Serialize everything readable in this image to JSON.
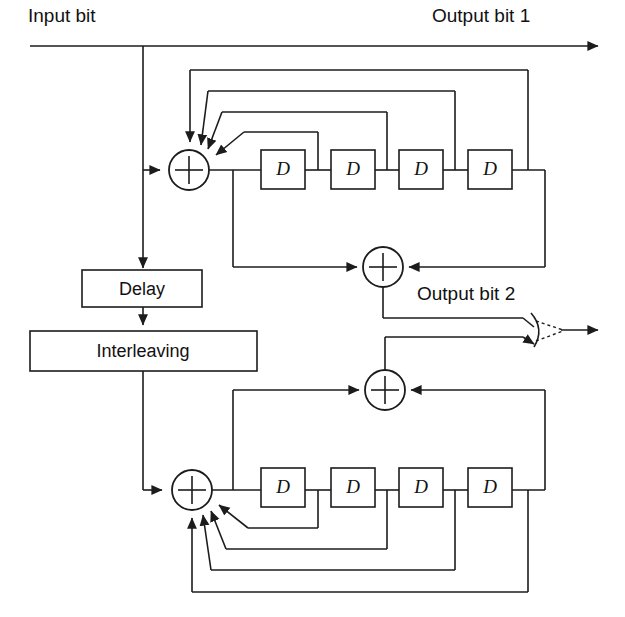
{
  "diagram": {
    "labels": {
      "input_bit": "Input bit",
      "output_bit_1": "Output bit 1",
      "output_bit_2": "Output bit 2"
    },
    "blocks": {
      "delay": "Delay",
      "interleaving": "Interleaving"
    },
    "delay_elements": {
      "label": "D",
      "upper_count": 4,
      "lower_count": 4,
      "upper": [
        "D",
        "D",
        "D",
        "D"
      ],
      "lower": [
        "D",
        "D",
        "D",
        "D"
      ]
    },
    "adders": {
      "upper_encoder_adder": "+",
      "upper_parity_adder": "+",
      "lower_parity_adder": "+",
      "lower_encoder_adder": "+"
    },
    "icons": {
      "adder": "xor-adder-icon",
      "switch": "multiplexer-switch-icon",
      "arrow": "arrowhead-icon"
    },
    "colors": {
      "line": "#1c1c1c",
      "background": "#ffffff",
      "text": "#111111"
    }
  }
}
